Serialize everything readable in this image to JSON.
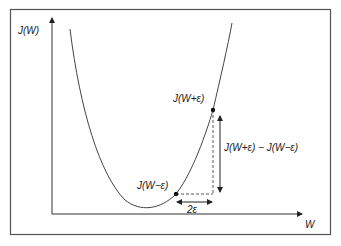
{
  "diagram": {
    "axes": {
      "y_label": "J(W)",
      "x_label": "W"
    },
    "points": [
      {
        "id": "plus",
        "label": "J(W+ε)"
      },
      {
        "id": "minus",
        "label": "J(W−ε)"
      }
    ],
    "annotations": {
      "vertical_difference": "J(W+ε) − J(W−ε)",
      "horizontal_step": "2ε"
    },
    "colors": {
      "stroke": "#333333",
      "frame": "#555555",
      "background": "#ffffff"
    }
  }
}
